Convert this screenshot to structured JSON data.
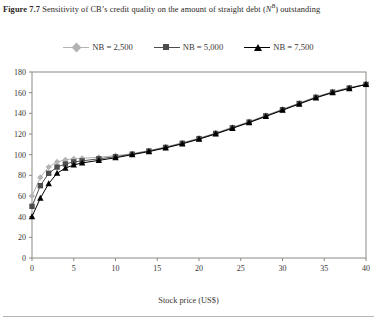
{
  "caption": {
    "figure_number": "Figure 7.7",
    "text_before": "Sensitivity of CB’s credit quality on the amount of straight debt (",
    "symbol": "N",
    "symbol_sup": "B",
    "text_after": ") outstanding",
    "full": "Figure 7.7  Sensitivity of CB’s credit quality on the amount of straight debt (Nᴮ) outstanding"
  },
  "legend": {
    "position": "top-center",
    "items": [
      {
        "label": "NB = 2,500",
        "color": "#b3b3b3",
        "marker": "diamond"
      },
      {
        "label": "NB = 5,000",
        "color": "#4d4d4d",
        "marker": "square"
      },
      {
        "label": "NB = 7,500",
        "color": "#000000",
        "marker": "triangle"
      }
    ]
  },
  "axes": {
    "xlabel": "Stock price (US$)",
    "ylabel": "Convertible price (US$)",
    "xticks": [
      "0",
      "5",
      "10",
      "15",
      "20",
      "25",
      "30",
      "35",
      "40"
    ],
    "yticks": [
      "0",
      "20",
      "40",
      "60",
      "80",
      "100",
      "120",
      "140",
      "160",
      "180"
    ]
  },
  "chart_data": {
    "type": "line",
    "xlabel": "Stock price (US$)",
    "ylabel": "Convertible price (US$)",
    "xlim": [
      0,
      40
    ],
    "ylim": [
      0,
      180
    ],
    "xticks": [
      0,
      5,
      10,
      15,
      20,
      25,
      30,
      35,
      40
    ],
    "yticks": [
      0,
      20,
      40,
      60,
      80,
      100,
      120,
      140,
      160,
      180
    ],
    "grid": false,
    "legend_position": "top-center",
    "x": [
      0,
      1,
      2,
      3,
      4,
      5,
      6,
      8,
      10,
      12,
      14,
      16,
      18,
      20,
      22,
      24,
      26,
      28,
      30,
      32,
      34,
      36,
      38,
      40
    ],
    "series": [
      {
        "name": "NB = 2,500",
        "color": "#b3b3b3",
        "marker": "diamond",
        "values": [
          60,
          78,
          88,
          93,
          95,
          96,
          96.5,
          97.5,
          99,
          101,
          104,
          107.5,
          111.5,
          116,
          121,
          126.5,
          132,
          138,
          144,
          150,
          156,
          161,
          165,
          168
        ]
      },
      {
        "name": "NB = 5,000",
        "color": "#4d4d4d",
        "marker": "square",
        "values": [
          50,
          70,
          82,
          88,
          91,
          93,
          94,
          96,
          98,
          100.5,
          103.5,
          107,
          111,
          115.5,
          120.5,
          126,
          131.5,
          137.5,
          143.5,
          149.5,
          155.5,
          160.5,
          164.5,
          168
        ]
      },
      {
        "name": "NB = 7,500",
        "color": "#000000",
        "marker": "triangle",
        "values": [
          40,
          58,
          72,
          82,
          87,
          90,
          92,
          94.5,
          97,
          100,
          103,
          106.5,
          110.5,
          115,
          120,
          125.5,
          131,
          137,
          143,
          149,
          155,
          160,
          164,
          168
        ]
      }
    ]
  }
}
